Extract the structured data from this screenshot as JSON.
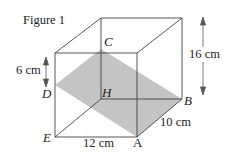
{
  "figure": {
    "title": "Figure 1",
    "vertices": {
      "C": "C",
      "D": "D",
      "H": "H",
      "B": "B",
      "E": "E",
      "A": "A"
    },
    "dimensions": {
      "height_left": "6 cm",
      "height_right": "16 cm",
      "width_bottom": "12 cm",
      "depth": "10 cm"
    },
    "colors": {
      "line": "#444444",
      "shade": "#bdbdbd",
      "background": "#ffffff"
    }
  }
}
